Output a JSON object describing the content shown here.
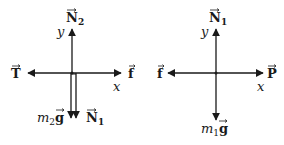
{
  "diagrams": [
    {
      "name": "free-body-diagram-block-2",
      "axes": {
        "x_label": "x",
        "y_label": "y"
      },
      "forces": {
        "up": {
          "symbol": "N",
          "subscript": "2",
          "vector": true
        },
        "left": {
          "symbol": "T",
          "subscript": "",
          "vector": true
        },
        "right": {
          "symbol": "f",
          "subscript": "",
          "vector": true
        },
        "down_a": {
          "prefix": "m",
          "prefix_sub": "2",
          "symbol": "g",
          "vector": true
        },
        "down_b": {
          "symbol": "N",
          "subscript": "1",
          "vector": true
        }
      }
    },
    {
      "name": "free-body-diagram-block-1",
      "axes": {
        "x_label": "x",
        "y_label": "y"
      },
      "forces": {
        "up": {
          "symbol": "N",
          "subscript": "1",
          "vector": true
        },
        "left": {
          "symbol": "f",
          "subscript": "",
          "vector": true
        },
        "right": {
          "symbol": "P",
          "subscript": "",
          "vector": true
        },
        "down": {
          "prefix": "m",
          "prefix_sub": "1",
          "symbol": "g",
          "vector": true
        }
      }
    }
  ],
  "colors": {
    "stroke": "#1a1a1a",
    "background": "#ffffff"
  }
}
